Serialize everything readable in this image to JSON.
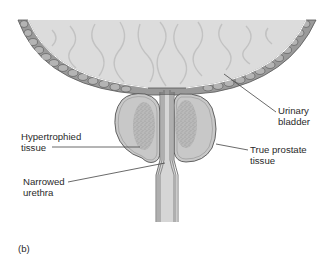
{
  "figure": {
    "panel_label": "(b)",
    "colors": {
      "background": "#ffffff",
      "bladder_fill": "#dcdcdc",
      "bladder_wall_fill": "#9a9a9a",
      "stone_fill": "#b4b4b4",
      "prostate_fill": "#c8c8c8",
      "hypertrophied_fill": "#a8a8a8",
      "urethra_fill": "#d6d6d6",
      "outline": "#555555",
      "leader_line": "#444444",
      "text": "#2a2a2a"
    },
    "labels": {
      "urinary_bladder_line1": "Urinary",
      "urinary_bladder_line2": "bladder",
      "hypertrophied_line1": "Hypertrophied",
      "hypertrophied_line2": "tissue",
      "true_prostate_line1": "True prostate",
      "true_prostate_line2": "tissue",
      "narrowed_line1": "Narrowed",
      "narrowed_line2": "urethra"
    }
  }
}
